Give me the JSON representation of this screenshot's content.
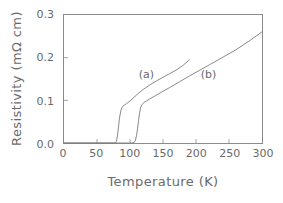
{
  "chart_data": {
    "type": "line",
    "title": "",
    "xlabel": "Temperature (K)",
    "ylabel": "Resistivity (mΩ cm)",
    "xlim": [
      0,
      300
    ],
    "ylim": [
      0.0,
      0.3
    ],
    "xticks": [
      "0",
      "50",
      "100",
      "150",
      "200",
      "250",
      "300"
    ],
    "xtick_values": [
      0,
      50,
      100,
      150,
      200,
      250,
      300
    ],
    "yticks": [
      "0.0",
      "0.1",
      "0.2",
      "0.3"
    ],
    "ytick_values": [
      0.0,
      0.1,
      0.2,
      0.3
    ],
    "grid": false,
    "legend_position": "inline-annotations",
    "line_color": "#7a7a7a",
    "frame_color": "#8b8b8b",
    "text_color": "#6a6a6a",
    "series": [
      {
        "name": "(a)",
        "label": "(a)",
        "annotation_x": 112,
        "annotation_y": 0.163,
        "x": [
          0,
          20,
          40,
          60,
          72,
          76,
          78,
          79.5,
          81,
          82.5,
          84,
          86,
          88,
          91,
          95,
          100,
          106,
          112,
          120,
          130,
          140,
          150,
          160,
          170,
          180,
          190
        ],
        "y": [
          0.0,
          0.0,
          0.0,
          0.0,
          0.0,
          0.0,
          0.0005,
          0.004,
          0.016,
          0.037,
          0.058,
          0.075,
          0.084,
          0.0885,
          0.0925,
          0.0985,
          0.107,
          0.1155,
          0.1255,
          0.136,
          0.1455,
          0.154,
          0.1625,
          0.171,
          0.1815,
          0.195
        ]
      },
      {
        "name": "(b)",
        "label": "(b)",
        "annotation_x": 205,
        "annotation_y": 0.163,
        "x": [
          0,
          20,
          40,
          60,
          80,
          95,
          103,
          106,
          108,
          110,
          111.5,
          113,
          114.5,
          116,
          118,
          121,
          125,
          130,
          138,
          148,
          160,
          175,
          190,
          205,
          220,
          240,
          260,
          280,
          300
        ],
        "y": [
          0.0,
          0.0,
          0.0,
          0.0,
          0.0,
          0.0,
          0.0,
          0.001,
          0.005,
          0.018,
          0.034,
          0.053,
          0.07,
          0.082,
          0.09,
          0.0945,
          0.0985,
          0.1035,
          0.1105,
          0.1195,
          0.13,
          0.1435,
          0.157,
          0.17,
          0.183,
          0.2005,
          0.218,
          0.2385,
          0.2605
        ]
      }
    ]
  },
  "axes": {
    "x_title": "Temperature (K)",
    "y_title": "Resistivity (mΩ cm)",
    "x_tick_labels": [
      "0",
      "50",
      "100",
      "150",
      "200",
      "250",
      "300"
    ],
    "y_tick_labels": [
      "0.0",
      "0.1",
      "0.2",
      "0.3"
    ]
  },
  "annotations": {
    "curve_a": "(a)",
    "curve_b": "(b)"
  }
}
